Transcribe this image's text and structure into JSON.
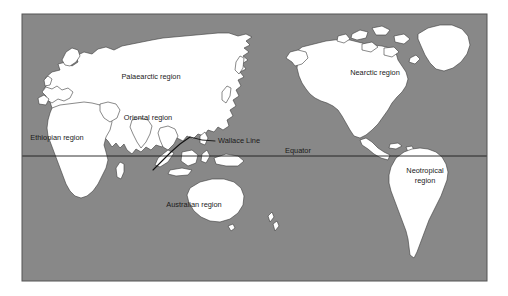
{
  "figure": {
    "kind": "world-map",
    "frame": {
      "x": 22,
      "y": 14,
      "width": 465,
      "height": 267
    }
  },
  "colors": {
    "page_background": "#ffffff",
    "ocean": "#888888",
    "land": "#ffffff",
    "land_shadow": "#6f6f6f",
    "coastline": "#3a3a3a",
    "frame_border": "#555555",
    "equator_line": "#1c1c1c",
    "wallace_line": "#111111",
    "label_text": "#1a1a1a"
  },
  "regions": [
    {
      "id": "palaearctic",
      "label": "Palaearctic region",
      "x": 151,
      "y": 77,
      "lines": [
        "Palaearctic region"
      ]
    },
    {
      "id": "oriental",
      "label": "Oriental region",
      "x": 148,
      "y": 118,
      "lines": [
        "Oriental region"
      ]
    },
    {
      "id": "ethiopian",
      "label": "Ethiopian region",
      "x": 57,
      "y": 138,
      "lines": [
        "Ethiopian region"
      ]
    },
    {
      "id": "australian",
      "label": "Australian region",
      "x": 194,
      "y": 205,
      "lines": [
        "Australian region"
      ]
    },
    {
      "id": "nearctic",
      "label": "Nearctic region",
      "x": 375,
      "y": 73,
      "lines": [
        "Nearctic region"
      ]
    },
    {
      "id": "neotropical",
      "label": "Neotropical region",
      "x": 425,
      "y": 176,
      "lines": [
        "Neotropical",
        "region"
      ]
    }
  ],
  "annotations": [
    {
      "id": "wallace-line",
      "label": "Wallace Line",
      "label_x": 218,
      "label_y": 141,
      "leader": {
        "x1": 215,
        "y1": 141,
        "x2": 186,
        "y2": 137
      },
      "line": {
        "x1": 155,
        "y1": 168,
        "x2": 190,
        "y2": 136
      }
    }
  ],
  "equator": {
    "label": "Equator",
    "label_x": 298,
    "label_y": 152,
    "y": 156,
    "x_start": 22,
    "x_end": 487
  }
}
